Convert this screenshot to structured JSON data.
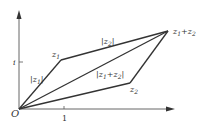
{
  "diagram": {
    "colors": {
      "line": "#333333",
      "axis": "#555555",
      "background": "#ffffff"
    },
    "axes": {
      "origin_label": "O",
      "x_tick_label": "1",
      "y_tick_label": "i"
    },
    "points": {
      "z1": {
        "label": "z",
        "sub": "1"
      },
      "z2": {
        "label": "z",
        "sub": "2"
      },
      "sum": {
        "label_a": "z",
        "sub_a": "1",
        "plus": "+",
        "label_b": "z",
        "sub_b": "2"
      }
    },
    "segment_labels": {
      "mod_z1": {
        "open": "|z",
        "sub": "1",
        "close": "|"
      },
      "mod_z2": {
        "open": "|z",
        "sub": "2",
        "close": "|"
      },
      "mod_sum": {
        "open": "|z",
        "sub1": "1",
        "plus": "+z",
        "sub2": "2",
        "close": "|"
      }
    }
  }
}
